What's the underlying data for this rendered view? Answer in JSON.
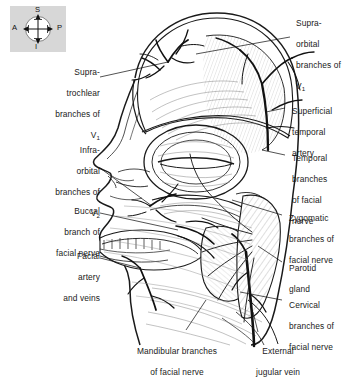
{
  "figure": {
    "background_color": "#ffffff",
    "line_color": "#1a1a1a",
    "label_color": "#1a1a1a",
    "shade_color": "#d7d7d7"
  },
  "orientation_key": {
    "name": "orientation-compass",
    "background": "#d7d7d7",
    "superior": "S",
    "inferior": "I",
    "anterior": "A",
    "posterior": "P"
  },
  "labels": {
    "supratrochlear": {
      "lines": [
        "Supra-",
        "trochlear",
        "branches of"
      ],
      "nerve": "V",
      "nerve_sub": "1",
      "align": "right"
    },
    "infraorbital": {
      "lines": [
        "Infra-",
        "orbital",
        "branches of"
      ],
      "nerve": "V",
      "nerve_sub": "2",
      "align": "right"
    },
    "buccal": {
      "lines": [
        "Buccal",
        "branch of",
        "facial nerve"
      ],
      "align": "right"
    },
    "facial_artery_veins": {
      "lines": [
        "Facial",
        "artery",
        "and veins"
      ],
      "align": "right"
    },
    "supraorbital": {
      "lines": [
        "Supra-",
        "orbital",
        "branches of"
      ],
      "nerve": "V",
      "nerve_sub": "1",
      "align": "left"
    },
    "superficial_temporal_artery": {
      "lines": [
        "Superficial",
        "temporal",
        "artery"
      ],
      "align": "left"
    },
    "temporal_branches": {
      "lines": [
        "Temporal",
        "branches",
        "of facial",
        "nerve"
      ],
      "align": "left"
    },
    "zygomatic_branches": {
      "lines": [
        "Zygomatic",
        "branches of",
        "facial nerve"
      ],
      "align": "left"
    },
    "parotid_gland": {
      "lines": [
        "Parotid",
        "gland"
      ],
      "align": "left"
    },
    "cervical_branches": {
      "lines": [
        "Cervical",
        "branches of",
        "facial nerve"
      ],
      "align": "left"
    },
    "mandibular_branches": {
      "lines": [
        "Mandibular branches",
        "of facial nerve"
      ],
      "align": "center"
    },
    "external_jugular_vein": {
      "lines": [
        "External",
        "jugular vein"
      ],
      "align": "center"
    }
  }
}
